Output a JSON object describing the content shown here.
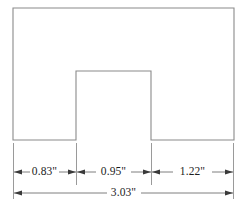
{
  "drawing": {
    "title": "Notched rectangle part outline with linear dimensions",
    "units": "inches",
    "unit_mark": "\"",
    "colors": {
      "outline_stroke": "#8a8a8a",
      "dimension_stroke": "#6f6f6f",
      "extension_stroke": "#8f8f8f",
      "arrow_fill": "#3a3a3a",
      "text": "#1d1d1d",
      "background": "#ffffff"
    },
    "shape": {
      "name": "notched-rectangle",
      "outer_left_x": 13,
      "outer_right_x": 234,
      "outer_top_y": 8,
      "outer_bottom_y": 140,
      "notch_left_x": 76,
      "notch_right_x": 151,
      "notch_top_y": 71,
      "path": "M 13 8 L 234 8 L 234 140 L 151 140 L 151 71 L 76 71 L 76 140 L 13 140 Z"
    },
    "dimensions": {
      "segment_line_y": 172,
      "overall_line_y": 193,
      "extension_top_y": 143,
      "segment_ext_bottom_y": 185,
      "overall_ext_bottom_y": 199,
      "segments": [
        {
          "id": "left-flange",
          "label": "0.83\"",
          "value": 0.83,
          "x_start": 13,
          "x_end": 76,
          "text_x": 44.5
        },
        {
          "id": "center-notch",
          "label": "0.95\"",
          "value": 0.95,
          "x_start": 76,
          "x_end": 151,
          "text_x": 113.5
        },
        {
          "id": "right-flange",
          "label": "1.22\"",
          "value": 1.22,
          "x_start": 151,
          "x_end": 234,
          "text_x": 192.5
        }
      ],
      "overall": {
        "id": "overall-width",
        "label": "3.03\"",
        "value": 3.03,
        "x_start": 13,
        "x_end": 234,
        "text_x": 123.5
      }
    }
  }
}
